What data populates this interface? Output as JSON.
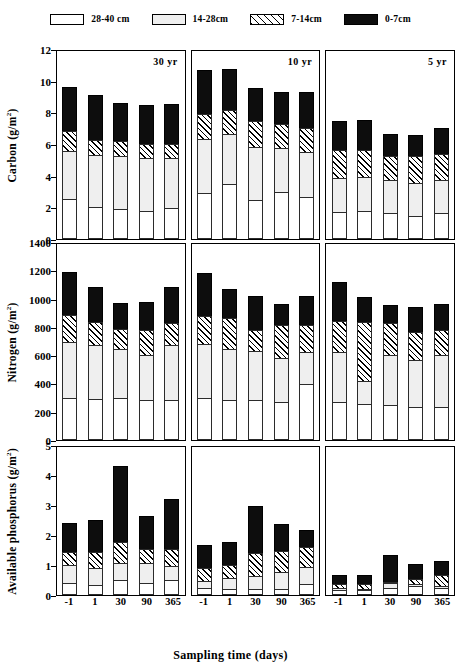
{
  "legend": {
    "items": [
      {
        "label": "28-40 cm",
        "key": "d0",
        "color": "#ffffff"
      },
      {
        "label": "14-28cm",
        "key": "d1",
        "color": "#efefef"
      },
      {
        "label": "7-14cm",
        "key": "d2",
        "color": "#ffffff"
      },
      {
        "label": "0-7cm",
        "key": "d3",
        "color": "#0d0d0d"
      }
    ]
  },
  "axis": {
    "xlabel": "Sampling time (days)",
    "xticks": [
      "-1",
      "1",
      "30",
      "90",
      "365"
    ],
    "group_labels": [
      "30 yr",
      "10 yr",
      "5 yr"
    ]
  },
  "chart_data": [
    {
      "type": "bar",
      "stacked": true,
      "panel": "carbon",
      "title": "",
      "ylabel": "Carbon (g/m2)",
      "ylabel_base": "Carbon (g/m",
      "ylabel_sup": "2",
      "ylabel_tail": ")",
      "xlabel": "Sampling time (days)",
      "ylim": [
        0,
        12
      ],
      "yticks": [
        0,
        2,
        4,
        6,
        8,
        10,
        12
      ],
      "grid": false,
      "legend_position": "top",
      "categories": [
        "-1",
        "1",
        "30",
        "90",
        "365"
      ],
      "groups": [
        "30 yr",
        "10 yr",
        "5 yr"
      ],
      "series": [
        {
          "name": "28-40 cm",
          "values": {
            "30 yr": [
              2.5,
              2.0,
              1.9,
              1.8,
              1.95
            ],
            "10 yr": [
              2.9,
              3.45,
              2.45,
              2.95,
              2.65
            ],
            "5 yr": [
              1.7,
              1.8,
              1.65,
              1.45,
              1.65
            ]
          }
        },
        {
          "name": "14-28cm",
          "values": {
            "30 yr": [
              3.1,
              3.4,
              3.4,
              3.4,
              3.25
            ],
            "10 yr": [
              3.5,
              3.25,
              3.45,
              2.85,
              2.9
            ],
            "5 yr": [
              2.2,
              2.2,
              2.15,
              2.15,
              2.15
            ]
          }
        },
        {
          "name": "7-14cm",
          "values": {
            "30 yr": [
              1.35,
              1.0,
              1.0,
              0.9,
              0.9
            ],
            "10 yr": [
              1.6,
              1.55,
              1.7,
              1.6,
              1.6
            ],
            "5 yr": [
              1.85,
              1.75,
              1.6,
              1.75,
              1.7
            ]
          }
        },
        {
          "name": "0-7cm",
          "values": {
            "30 yr": [
              2.85,
              2.9,
              2.45,
              2.55,
              2.6
            ],
            "10 yr": [
              2.85,
              2.7,
              2.1,
              2.1,
              2.35
            ],
            "5 yr": [
              1.9,
              1.95,
              1.4,
              1.4,
              1.7
            ]
          }
        }
      ],
      "totals": {
        "30 yr": [
          9.8,
          9.3,
          8.75,
          8.65,
          8.7
        ],
        "10 yr": [
          10.85,
          10.95,
          9.7,
          9.5,
          9.5
        ],
        "5 yr": [
          7.65,
          7.7,
          6.8,
          6.75,
          7.2
        ]
      }
    },
    {
      "type": "bar",
      "stacked": true,
      "panel": "nitrogen",
      "title": "",
      "ylabel": "Nitrogen (g/m2)",
      "ylabel_base": "Nitrogen (g/m",
      "ylabel_sup": "2",
      "ylabel_tail": ")",
      "xlabel": "Sampling time (days)",
      "ylim": [
        0,
        1400
      ],
      "yticks": [
        0,
        200,
        400,
        600,
        800,
        1000,
        1200,
        1400
      ],
      "grid": false,
      "legend_position": "top",
      "categories": [
        "-1",
        "1",
        "30",
        "90",
        "365"
      ],
      "groups": [
        "30 yr",
        "10 yr",
        "5 yr"
      ],
      "series": [
        {
          "name": "28-40 cm",
          "values": {
            "30 yr": [
              300,
              290,
              295,
              285,
              280
            ],
            "10 yr": [
              295,
              280,
              280,
              270,
              395
            ],
            "5 yr": [
              270,
              255,
              245,
              235,
              235
            ]
          }
        },
        {
          "name": "14-28cm",
          "values": {
            "30 yr": [
              400,
              390,
              355,
              320,
              400
            ],
            "10 yr": [
              390,
              370,
              355,
              320,
              235
            ],
            "5 yr": [
              360,
              170,
              365,
              340,
              370
            ]
          }
        },
        {
          "name": "7-14cm",
          "values": {
            "30 yr": [
              200,
              170,
              150,
              190,
              160
            ],
            "10 yr": [
              205,
              225,
              155,
              240,
              200
            ],
            "5 yr": [
              225,
              425,
              235,
              205,
              185
            ]
          }
        },
        {
          "name": "0-7cm",
          "values": {
            "30 yr": [
              310,
              250,
              190,
              200,
              260
            ],
            "10 yr": [
              315,
              215,
              250,
              150,
              210
            ],
            "5 yr": [
              285,
              185,
              130,
              180,
              195
            ]
          }
        }
      ],
      "totals": {
        "30 yr": [
          1210,
          1100,
          990,
          995,
          1100
        ],
        "10 yr": [
          1205,
          1090,
          1040,
          980,
          1040
        ],
        "5 yr": [
          1140,
          1035,
          975,
          960,
          985
        ]
      }
    },
    {
      "type": "bar",
      "stacked": true,
      "panel": "phosphorus",
      "title": "",
      "ylabel": "Available phosphorus (g/m2)",
      "ylabel_base": "Available phosphorus (g/m",
      "ylabel_sup": "2",
      "ylabel_tail": ")",
      "xlabel": "Sampling time (days)",
      "ylim": [
        0,
        5
      ],
      "yticks": [
        0,
        1,
        2,
        3,
        4,
        5
      ],
      "grid": false,
      "legend_position": "top",
      "categories": [
        "-1",
        "1",
        "30",
        "90",
        "365"
      ],
      "groups": [
        "30 yr",
        "10 yr",
        "5 yr"
      ],
      "series": [
        {
          "name": "28-40 cm",
          "values": {
            "30 yr": [
              0.4,
              0.32,
              0.5,
              0.41,
              0.49
            ],
            "10 yr": [
              0.24,
              0.2,
              0.2,
              0.19,
              0.38
            ],
            "5 yr": [
              0.16,
              0.16,
              0.23,
              0.3,
              0.25
            ]
          }
        },
        {
          "name": "14-28cm",
          "values": {
            "30 yr": [
              0.62,
              0.6,
              0.6,
              0.68,
              0.52
            ],
            "10 yr": [
              0.25,
              0.4,
              0.47,
              0.6,
              0.6
            ],
            "5 yr": [
              0.1,
              0.09,
              0.21,
              0.11,
              0.1
            ]
          }
        },
        {
          "name": "7-14cm",
          "values": {
            "30 yr": [
              0.48,
              0.58,
              0.74,
              0.51,
              0.6
            ],
            "10 yr": [
              0.49,
              0.48,
              0.8,
              0.76,
              0.7
            ],
            "5 yr": [
              0.19,
              0.18,
              0.06,
              0.18,
              0.38
            ]
          }
        },
        {
          "name": "0-7cm",
          "values": {
            "30 yr": [
              1.0,
              1.1,
              2.56,
              1.15,
              1.68
            ],
            "10 yr": [
              0.8,
              0.8,
              1.6,
              0.92,
              0.6
            ],
            "5 yr": [
              0.33,
              0.33,
              0.95,
              0.56,
              0.52
            ]
          }
        }
      ],
      "totals": {
        "30 yr": [
          2.5,
          2.6,
          4.4,
          2.75,
          3.29
        ],
        "10 yr": [
          1.78,
          1.88,
          3.07,
          2.47,
          2.28
        ],
        "5 yr": [
          0.78,
          0.76,
          1.45,
          1.15,
          1.25
        ]
      }
    }
  ]
}
